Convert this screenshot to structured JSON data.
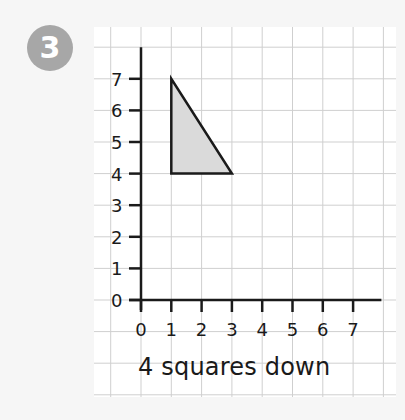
{
  "question": {
    "number": "3",
    "caption": "4 squares down"
  },
  "colors": {
    "background": "#f6f6f6",
    "panel": "#ffffff",
    "grid": "#cfcfcf",
    "axis": "#1a1a1a",
    "badge": "#a7a7a7",
    "shape_fill": "#dadada",
    "shape_stroke": "#1a1a1a"
  },
  "chart_data": {
    "type": "coordinate-grid",
    "title": "",
    "xlabel": "",
    "ylabel": "",
    "x_ticks": [
      0,
      1,
      2,
      3,
      4,
      5,
      6,
      7
    ],
    "y_ticks": [
      0,
      1,
      2,
      3,
      4,
      5,
      6,
      7
    ],
    "xlim": [
      0,
      7
    ],
    "ylim": [
      0,
      7
    ],
    "grid": true,
    "shapes": [
      {
        "type": "triangle",
        "vertices": [
          [
            1,
            7
          ],
          [
            1,
            4
          ],
          [
            3,
            4
          ]
        ],
        "fill": "#dadada"
      }
    ],
    "annotation": "4 squares down"
  }
}
